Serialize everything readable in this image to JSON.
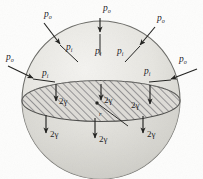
{
  "figure": {
    "shape": "sphere",
    "equatorial_section": {
      "name": "hatched-equatorial-disc",
      "hatched": true,
      "hatch_angle_deg": 45
    },
    "radius_label": "r"
  },
  "labels": {
    "p_outer": {
      "symbol": "p",
      "subscript": "o"
    },
    "p_inner": {
      "symbol": "p",
      "subscript": "i"
    },
    "surface_tension": "2γ",
    "radius": "r"
  },
  "external_pressure_arrows": [
    {
      "id": "p0-top",
      "label": "p",
      "sub": "o",
      "lx": 103,
      "ly": 11,
      "x1": 100,
      "y1": 18,
      "x2": 100,
      "y2": 32
    },
    {
      "id": "p0-top-left",
      "label": "p",
      "sub": "o",
      "lx": 48,
      "ly": 17,
      "x1": 44,
      "y1": 23,
      "x2": 60,
      "y2": 44
    },
    {
      "id": "p0-top-right",
      "label": "p",
      "sub": "o",
      "lx": 157,
      "ly": 21,
      "x1": 155,
      "y1": 27,
      "x2": 140,
      "y2": 45
    },
    {
      "id": "p0-left",
      "label": "p",
      "sub": "o",
      "lx": 9,
      "ly": 60,
      "x1": 8,
      "y1": 66,
      "x2": 33,
      "y2": 78
    },
    {
      "id": "p0-right",
      "label": "p",
      "sub": "o",
      "lx": 181,
      "ly": 62,
      "x1": 197,
      "y1": 69,
      "x2": 171,
      "y2": 79
    }
  ],
  "internal_pressure_labels": [
    {
      "id": "pi-top-center-left",
      "label": "p",
      "sub": "i",
      "lx": 97,
      "ly": 51
    },
    {
      "id": "pi-top-center-right",
      "label": "p",
      "sub": "i",
      "lx": 119,
      "ly": 51
    },
    {
      "id": "pi-upper-left",
      "label": "p",
      "sub": "i",
      "lx": 66,
      "ly": 48
    },
    {
      "id": "pi-mid-left",
      "label": "p",
      "sub": "i",
      "lx": 42,
      "ly": 73
    },
    {
      "id": "pi-mid-right",
      "label": "p",
      "sub": "i",
      "lx": 146,
      "ly": 73
    }
  ],
  "internal_pressure_arrows": [
    {
      "id": "pi-arrow-top",
      "x1": 100,
      "y1": 34,
      "x2": 100,
      "y2": 55
    },
    {
      "id": "pi-arrow-upper-left",
      "x1": 60,
      "y1": 45,
      "x2": 78,
      "y2": 62
    },
    {
      "id": "pi-arrow-upper-right",
      "x1": 140,
      "y1": 46,
      "x2": 125,
      "y2": 62
    },
    {
      "id": "pi-arrow-left",
      "x1": 33,
      "y1": 79,
      "x2": 52,
      "y2": 82
    },
    {
      "id": "pi-arrow-right",
      "x1": 171,
      "y1": 80,
      "x2": 152,
      "y2": 82
    }
  ],
  "tension_arrows_upper": [
    {
      "id": "tension-upper-1",
      "label": "2γ",
      "x": 56,
      "y1": 84,
      "y2": 101,
      "lx": 60,
      "ly": 103
    },
    {
      "id": "tension-upper-2",
      "label": "2γ",
      "x": 101,
      "y1": 84,
      "y2": 100,
      "lx": 105,
      "ly": 102
    },
    {
      "id": "tension-upper-3",
      "label": "2γ",
      "x": 150,
      "y1": 85,
      "y2": 104,
      "lx": 132,
      "ly": 107
    }
  ],
  "tension_arrows_lower": [
    {
      "id": "tension-lower-1",
      "label": "2γ",
      "x": 46,
      "y1": 115,
      "y2": 133,
      "lx": 50,
      "ly": 136
    },
    {
      "id": "tension-lower-2",
      "label": "2γ",
      "x": 95,
      "y1": 118,
      "y2": 138,
      "lx": 99,
      "ly": 141
    },
    {
      "id": "tension-lower-3",
      "label": "2γ",
      "x": 143,
      "y1": 116,
      "y2": 133,
      "lx": 147,
      "ly": 136
    }
  ],
  "radius_indicator": {
    "id": "radius-leader",
    "label": "r",
    "cx": 97,
    "cy": 103,
    "x2": 128,
    "y2": 126,
    "lx": 100,
    "ly": 115
  },
  "colors": {
    "ink": "#20201e",
    "sphere_fill": "#e8e7e3",
    "sphere_edge": "#6a6a66",
    "hatch": "#58585a",
    "paper": "#fdfdfc"
  }
}
